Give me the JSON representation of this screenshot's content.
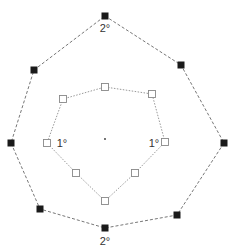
{
  "diagram": {
    "center": {
      "x": 105,
      "y": 139
    },
    "outer_ring": {
      "label_top": "2°",
      "label_bottom": "2°",
      "label_top_pos": [
        105,
        32
      ],
      "label_bottom_pos": [
        105,
        245
      ],
      "color": "#1a1a1a",
      "stroke": "#777777",
      "points": [
        [
          105,
          16
        ],
        [
          181,
          65
        ],
        [
          224,
          143
        ],
        [
          177,
          215
        ],
        [
          105,
          228
        ],
        [
          40,
          209
        ],
        [
          11,
          143
        ],
        [
          34,
          70
        ]
      ]
    },
    "inner_ring": {
      "label_left": "1°",
      "label_right": "1°",
      "label_left_pos": [
        62,
        147
      ],
      "label_right_pos": [
        154,
        147
      ],
      "fill": "#ffffff",
      "stroke": "#888888",
      "points": [
        [
          105,
          87
        ],
        [
          152,
          94
        ],
        [
          165,
          142
        ],
        [
          135,
          173
        ],
        [
          105,
          201
        ],
        [
          76,
          173
        ],
        [
          47,
          143
        ],
        [
          63,
          99
        ]
      ]
    }
  }
}
